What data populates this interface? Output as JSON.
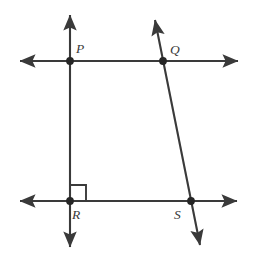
{
  "figure": {
    "background_color": "#ffffff",
    "line_color": "#3a3a3a",
    "point_color": "#262626",
    "label_color": "#3a3a3a",
    "width": 253,
    "height": 266
  },
  "labels": {
    "p": "P",
    "q": "Q",
    "r": "R",
    "s": "S"
  },
  "points": [
    {
      "name": "P",
      "x": 70,
      "y": 61
    },
    {
      "name": "Q",
      "x": 163,
      "y": 61
    },
    {
      "name": "R",
      "x": 70,
      "y": 201
    },
    {
      "name": "S",
      "x": 191,
      "y": 201
    }
  ],
  "label_positions": [
    {
      "name": "P",
      "x": 76,
      "y": 53
    },
    {
      "name": "Q",
      "x": 170,
      "y": 54
    },
    {
      "name": "R",
      "x": 72,
      "y": 219
    },
    {
      "name": "S",
      "x": 174,
      "y": 219
    }
  ],
  "lines": [
    {
      "name": "top-horizontal-line",
      "x1": 20,
      "y1": 61,
      "x2": 238,
      "y2": 61,
      "arrow_start": true,
      "arrow_end": true
    },
    {
      "name": "bottom-horizontal-line",
      "x1": 20,
      "y1": 201,
      "x2": 237,
      "y2": 201,
      "arrow_start": true,
      "arrow_end": true
    },
    {
      "name": "vertical-line",
      "x1": 70,
      "y1": 15,
      "x2": 70,
      "y2": 247,
      "arrow_start": true,
      "arrow_end": true
    },
    {
      "name": "transversal-line",
      "x1": 155,
      "y1": 20,
      "x2": 200,
      "y2": 245,
      "arrow_start": true,
      "arrow_end": true
    }
  ],
  "right_angle_marker": {
    "name": "right-angle-at-R",
    "vertex_x": 70,
    "vertex_y": 201,
    "size": 16,
    "path": "M 70 185 L 86 185 L 86 201"
  }
}
